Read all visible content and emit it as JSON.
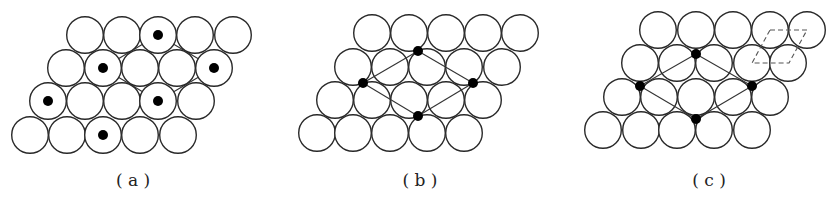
{
  "figure": {
    "panels": [
      {
        "id": "a",
        "label": "( a )",
        "label_x": 133,
        "radius": 18.3,
        "rows": [
          {
            "y": 35,
            "x": [
              85,
              122,
              158,
              195,
              233
            ]
          },
          {
            "y": 68,
            "x": [
              66,
              103,
              140,
              177,
              214
            ]
          },
          {
            "y": 101,
            "x": [
              48,
              85,
              122,
              158,
              196
            ]
          },
          {
            "y": 135,
            "x": [
              30,
              67,
              103,
              140,
              178
            ]
          }
        ],
        "dots": [
          [
            158,
            35
          ],
          [
            103,
            68
          ],
          [
            214,
            68
          ],
          [
            48,
            101
          ],
          [
            158,
            101
          ],
          [
            103,
            135
          ]
        ],
        "dot_radius": 5,
        "lines_under": true,
        "lines": [
          [
            [
              158,
              35
            ],
            [
              103,
              68
            ]
          ],
          [
            [
              103,
              68
            ],
            [
              158,
              101
            ]
          ],
          [
            [
              158,
              101
            ],
            [
              214,
              68
            ]
          ],
          [
            [
              214,
              68
            ],
            [
              158,
              35
            ]
          ]
        ],
        "dashed": []
      },
      {
        "id": "b",
        "label": "( b )",
        "label_x": 420,
        "radius": 18.3,
        "rows": [
          {
            "y": 33,
            "x": [
              372,
              409,
              446,
              483,
              520
            ]
          },
          {
            "y": 67,
            "x": [
              353,
              390,
              427,
              464,
              502
            ]
          },
          {
            "y": 100,
            "x": [
              335,
              372,
              409,
              446,
              483
            ]
          },
          {
            "y": 133,
            "x": [
              317,
              353,
              390,
              427,
              464
            ]
          }
        ],
        "dots": [
          [
            418,
            51
          ],
          [
            363,
            83
          ],
          [
            473,
            83
          ],
          [
            418,
            116
          ]
        ],
        "dot_radius": 5,
        "lines_under": false,
        "lines": [
          [
            [
              418,
              51
            ],
            [
              363,
              83
            ]
          ],
          [
            [
              363,
              83
            ],
            [
              418,
              116
            ]
          ],
          [
            [
              418,
              116
            ],
            [
              473,
              83
            ]
          ],
          [
            [
              473,
              83
            ],
            [
              418,
              51
            ]
          ]
        ],
        "dashed": []
      },
      {
        "id": "c",
        "label": "( c )",
        "label_x": 709,
        "radius": 18.3,
        "rows": [
          {
            "y": 30,
            "x": [
              658,
              696,
              733,
              770,
              807
            ]
          },
          {
            "y": 63,
            "x": [
              640,
              677,
              714,
              752,
              788
            ]
          },
          {
            "y": 97,
            "x": [
              622,
              659,
              696,
              733,
              770
            ]
          },
          {
            "y": 130,
            "x": [
              603,
              641,
              677,
              714,
              752
            ]
          }
        ],
        "dots": [
          [
            696,
            54
          ],
          [
            640,
            86
          ],
          [
            752,
            86
          ],
          [
            696,
            119
          ]
        ],
        "dot_radius": 5,
        "lines_under": false,
        "lines": [
          [
            [
              696,
              54
            ],
            [
              640,
              86
            ]
          ],
          [
            [
              640,
              86
            ],
            [
              696,
              119
            ]
          ],
          [
            [
              696,
              119
            ],
            [
              752,
              86
            ]
          ],
          [
            [
              752,
              86
            ],
            [
              696,
              54
            ]
          ]
        ],
        "dashed": [
          [
            770,
            30
          ],
          [
            807,
            30
          ],
          [
            789,
            63
          ],
          [
            752,
            63
          ]
        ]
      }
    ]
  }
}
